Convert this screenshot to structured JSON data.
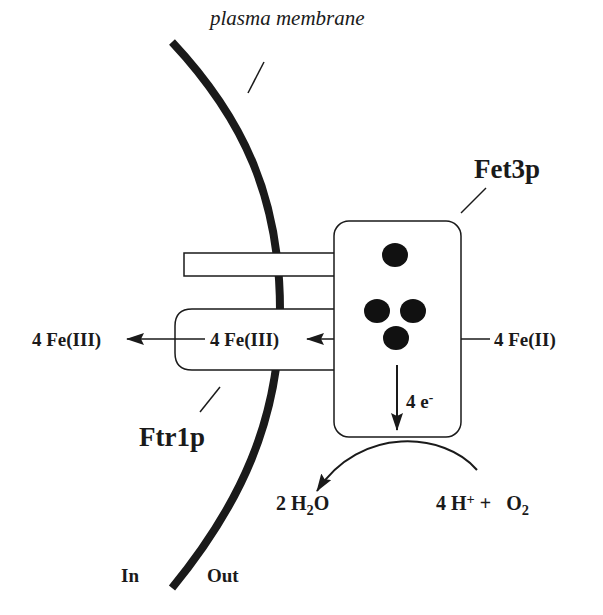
{
  "diagram": {
    "colors": {
      "ink": "#1a1a1a",
      "background": "#ffffff"
    },
    "labels": {
      "plasma_membrane": "plasma membrane",
      "fet3p": "Fet3p",
      "ftr1p": "Ftr1p",
      "fe3_inside": "4 Fe(III)",
      "fe3_channel": "4 Fe(III)",
      "fe2_outside": "4 Fe(II)",
      "electrons": {
        "base": "4 e",
        "sup": "-"
      },
      "water": {
        "pre": "2 H",
        "sub": "2",
        "post": "O"
      },
      "protons_oxygen": {
        "h": "4 H",
        "h_sup": "+",
        "plus": " +   O",
        "o_sub": "2"
      },
      "in": "In",
      "out": "Out"
    },
    "copper_sites": 4
  }
}
